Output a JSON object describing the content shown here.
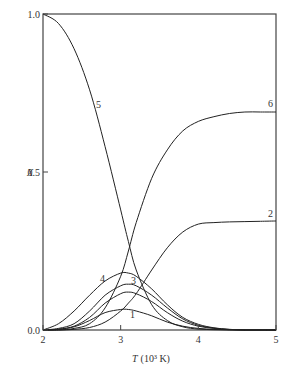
{
  "chart_data": {
    "type": "line",
    "title": "",
    "xlabel": "T (10³ K)",
    "ylabel": "X",
    "xlim": [
      2,
      5
    ],
    "ylim": [
      0,
      1.0
    ],
    "x_ticks": [
      "2",
      "3",
      "4",
      "5"
    ],
    "y_ticks": [
      "0.0",
      "0.5",
      "1.0"
    ],
    "grid": false,
    "legend": "inline curve labels",
    "x": [
      2.0,
      2.2,
      2.4,
      2.6,
      2.8,
      3.0,
      3.1,
      3.2,
      3.4,
      3.6,
      3.8,
      4.0,
      4.2,
      4.4,
      4.6,
      4.8,
      5.0
    ],
    "series": [
      {
        "name": "1",
        "values": [
          0.0,
          0.002,
          0.01,
          0.03,
          0.055,
          0.065,
          0.065,
          0.06,
          0.045,
          0.025,
          0.012,
          0.005,
          0.002,
          0.001,
          0.0,
          0.0,
          0.0
        ]
      },
      {
        "name": "2",
        "values": [
          0.0,
          0.0,
          0.002,
          0.008,
          0.025,
          0.06,
          0.085,
          0.115,
          0.19,
          0.26,
          0.31,
          0.335,
          0.34,
          0.342,
          0.343,
          0.344,
          0.345
        ]
      },
      {
        "name": "3",
        "values": [
          0.0,
          0.005,
          0.02,
          0.06,
          0.11,
          0.14,
          0.145,
          0.14,
          0.11,
          0.07,
          0.035,
          0.015,
          0.006,
          0.002,
          0.0,
          0.0,
          0.0
        ]
      },
      {
        "name": "4",
        "values": [
          0.0,
          0.02,
          0.06,
          0.11,
          0.155,
          0.18,
          0.18,
          0.17,
          0.13,
          0.08,
          0.04,
          0.018,
          0.007,
          0.002,
          0.0,
          0.0,
          0.0
        ]
      },
      {
        "name": "5",
        "values": [
          1.0,
          0.97,
          0.89,
          0.76,
          0.58,
          0.38,
          0.28,
          0.19,
          0.08,
          0.03,
          0.01,
          0.003,
          0.001,
          0.0,
          0.0,
          0.0,
          0.0
        ]
      },
      {
        "name": "6",
        "values": [
          0.0,
          0.0,
          0.005,
          0.02,
          0.07,
          0.17,
          0.25,
          0.34,
          0.48,
          0.57,
          0.63,
          0.66,
          0.675,
          0.685,
          0.69,
          0.69,
          0.69
        ]
      },
      {
        "name": "unlabeled",
        "values": [
          0.0,
          0.003,
          0.012,
          0.04,
          0.085,
          0.115,
          0.12,
          0.115,
          0.09,
          0.055,
          0.028,
          0.012,
          0.005,
          0.001,
          0.0,
          0.0,
          0.0
        ]
      }
    ]
  },
  "axes": {
    "x_label_main": "T",
    "x_label_unit": "(10³ K)",
    "y_label": "X"
  }
}
